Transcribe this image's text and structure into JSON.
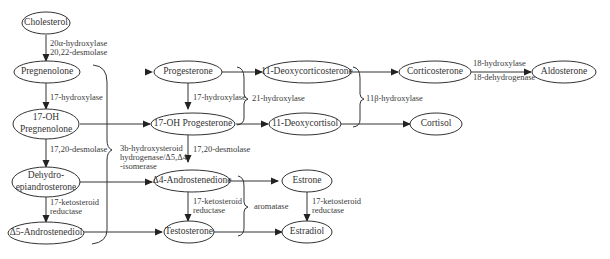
{
  "nodes": {
    "cholesterol": "Cholesterol",
    "pregnenolone": "Pregnenolone",
    "oh17_preg_line1": "17-OH",
    "oh17_preg_line2": "Pregnenolone",
    "dhea_line1": "Dehydro-",
    "dhea_line2": "epiandrosterone",
    "androstenediol": "Δ5-Androstenediol",
    "progesterone": "Progesterone",
    "oh17_prog": "17-OH Progesterone",
    "androstenedione": "Δ4-Androstenedione",
    "testosterone": "Testosterone",
    "deoxycorticosterone": "11-Deoxycorticosterone",
    "deoxycortisol": "11-Deoxycortisol",
    "corticosterone": "Corticosterone",
    "cortisol": "Cortisol",
    "aldosterone": "Aldosterone",
    "estrone": "Estrone",
    "estradiol": "Estradiol"
  },
  "enzymes": {
    "chol_to_preg_1": "20α-hydroxylase",
    "chol_to_preg_2": "20,22-desmolase",
    "hydroxylase17_left": "17-hydroxylase",
    "desmolase1720_left": "17,20-desmolase",
    "ketoreductase_left_1": "17-ketosteroid",
    "ketoreductase_left_2": "reductase",
    "hsd3b_1": "3b-hydroxysteroid",
    "hsd3b_2": "hydrogenase/Δ5,Δ4",
    "hsd3b_3": "-isomerase",
    "hydroxylase17_mid": "17-hydroxylase",
    "desmolase1720_mid": "17,20-desmolase",
    "ketoreductase_mid_1": "17-ketosteroid",
    "ketoreductase_mid_2": "reductase",
    "hydroxylase21": "21-hydroxylase",
    "aromatase": "aromatase",
    "hydroxylase11b": "11β-hydroxylase",
    "hydroxylase18": "18-hydroxylase",
    "dehydrogenase18": "18-dehydrogenase",
    "ketoreductase_right_1": "17-ketosteroid",
    "ketoreductase_right_2": "reductase"
  },
  "colors": {
    "stroke": "#333333",
    "highlight_arrow": "#5fd3c8"
  }
}
